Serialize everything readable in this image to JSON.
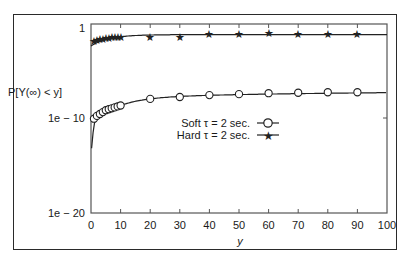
{
  "chart_data": {
    "type": "scatter",
    "title": "",
    "xlabel": "y",
    "ylabel": "P[Y(∞) < y]",
    "xlim": [
      0,
      100
    ],
    "ylim_log10": [
      -20,
      0
    ],
    "x_ticks": [
      "0",
      "10",
      "20",
      "30",
      "40",
      "50",
      "60",
      "70",
      "80",
      "90",
      "100"
    ],
    "y_ticks": [
      "1",
      "1e − 10",
      "1e − 20"
    ],
    "grid": false,
    "legend_position": "center-right",
    "series": [
      {
        "name": "Soft τ = 2 sec.",
        "marker": "circle",
        "x": [
          1,
          2,
          3,
          4,
          5,
          6,
          7,
          8,
          9,
          10,
          20,
          30,
          40,
          50,
          60,
          70,
          80,
          90
        ],
        "log10_y": [
          -9.6,
          -9.3,
          -9.1,
          -8.9,
          -8.7,
          -8.6,
          -8.5,
          -8.4,
          -8.3,
          -8.2,
          -7.5,
          -7.3,
          -7.1,
          -7.0,
          -6.9,
          -6.85,
          -6.8,
          -6.8
        ],
        "fit_curve": true
      },
      {
        "name": "Hard τ = 2 sec.",
        "marker": "star",
        "x": [
          1,
          2,
          3,
          4,
          5,
          6,
          7,
          8,
          9,
          10,
          20,
          30,
          40,
          50,
          60,
          70,
          80,
          90
        ],
        "log10_y": [
          -1.4,
          -1.3,
          -1.2,
          -1.15,
          -1.1,
          -1.05,
          -1.0,
          -1.0,
          -0.95,
          -0.95,
          -0.9,
          -0.9,
          -0.6,
          -0.6,
          -0.5,
          -0.6,
          -0.6,
          -0.6
        ],
        "fit_curve": true
      }
    ]
  },
  "axes": {
    "xlabel": "y",
    "ylabel": "P[Y(∞) < y]",
    "xticks": [
      "0",
      "10",
      "20",
      "30",
      "40",
      "50",
      "60",
      "70",
      "80",
      "90",
      "100"
    ],
    "yticks": [
      "1",
      "1e − 10",
      "1e − 20"
    ]
  },
  "legend": {
    "soft": "Soft τ = 2 sec.",
    "hard": "Hard τ = 2 sec."
  }
}
